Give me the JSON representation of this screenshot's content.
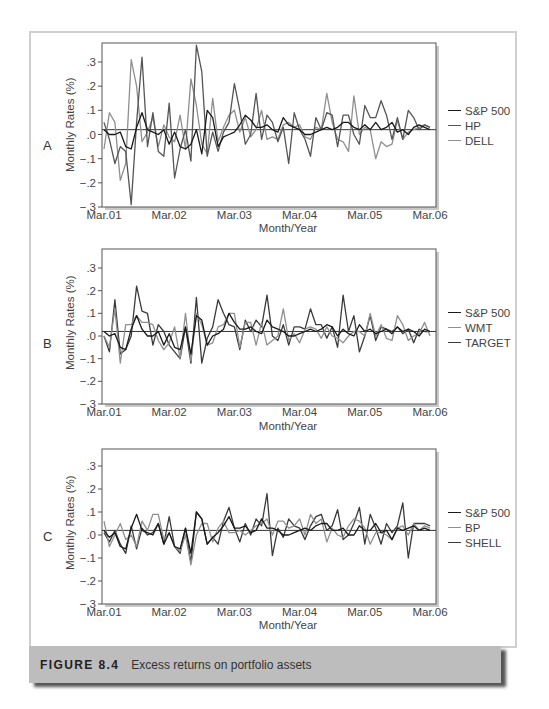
{
  "figure": {
    "number_label": "FIGURE 8.4",
    "caption": "Excess returns on portfolio assets",
    "colors": {
      "caption_bg": "#bdbdbd",
      "frame_border": "#cfcfcf",
      "sp500": "#1a1a1a",
      "second_series": "#555555",
      "third_series": "#8f8f8f"
    }
  },
  "chart_data": [
    {
      "panel": "A",
      "type": "line",
      "title": "",
      "xlabel": "Month/Year",
      "ylabel": "Monthly Rates (%)",
      "ylim": [
        -0.3,
        0.38
      ],
      "yticks": [
        ".3",
        ".2",
        ".1",
        ".0",
        "−.1",
        "−.2",
        "−.3"
      ],
      "ytick_values": [
        0.3,
        0.2,
        0.1,
        0.0,
        -0.1,
        -0.2,
        -0.3
      ],
      "xticks": [
        "Mar.01",
        "Mar.02",
        "Mar.03",
        "Mar.04",
        "Mar.05",
        "Mar.06"
      ],
      "reference_line": 0.02,
      "grid": false,
      "legend_position": "right",
      "x_count": 61,
      "series": [
        {
          "name": "S&P 500",
          "color": "#1a1a1a",
          "width": 1.3,
          "values": [
            0.02,
            0.0,
            0.0,
            0.01,
            -0.05,
            -0.06,
            0.03,
            0.09,
            0.02,
            0.01,
            0.0,
            0.02,
            -0.04,
            0.01,
            -0.05,
            -0.06,
            -0.04,
            0.02,
            -0.08,
            0.1,
            0.07,
            -0.05,
            -0.01,
            0.0,
            0.01,
            0.04,
            0.08,
            0.06,
            0.03,
            0.03,
            0.04,
            0.02,
            0.01,
            0.07,
            0.04,
            0.03,
            0.02,
            0.0,
            0.0,
            0.01,
            0.02,
            0.03,
            0.02,
            0.03,
            0.05,
            0.05,
            0.03,
            0.02,
            0.04,
            0.02,
            0.05,
            0.02,
            0.03,
            0.05,
            0.01,
            0.02,
            0.0,
            0.03,
            0.04,
            0.03,
            0.02
          ]
        },
        {
          "name": "HP",
          "color": "#555555",
          "width": 1.3,
          "values": [
            0.05,
            -0.02,
            -0.12,
            -0.05,
            -0.07,
            -0.29,
            0.05,
            0.32,
            -0.05,
            0.09,
            -0.07,
            -0.09,
            0.13,
            -0.18,
            -0.06,
            0.02,
            -0.11,
            0.37,
            0.26,
            -0.09,
            0.01,
            -0.07,
            0.01,
            0.05,
            0.21,
            0.1,
            -0.04,
            0.0,
            0.17,
            -0.02,
            0.08,
            0.05,
            -0.03,
            0.03,
            -0.12,
            0.09,
            0.02,
            -0.02,
            -0.09,
            0.07,
            0.02,
            0.09,
            0.08,
            -0.05,
            0.08,
            0.08,
            0.0,
            -0.04,
            0.12,
            0.07,
            0.07,
            0.14,
            0.08,
            -0.02,
            0.07,
            -0.02,
            0.1,
            0.07,
            0.02,
            0.04,
            0.03
          ]
        },
        {
          "name": "DELL",
          "color": "#8f8f8f",
          "width": 1.3,
          "values": [
            -0.06,
            0.09,
            0.05,
            -0.19,
            -0.12,
            0.31,
            0.2,
            -0.03,
            0.01,
            0.07,
            -0.05,
            0.04,
            -0.01,
            -0.03,
            0.08,
            -0.06,
            0.23,
            0.12,
            -0.04,
            -0.08,
            0.15,
            -0.03,
            0.03,
            0.08,
            0.1,
            0.01,
            0.07,
            -0.01,
            0.02,
            0.1,
            -0.02,
            -0.01,
            -0.02,
            0.04,
            0.05,
            0.03,
            0.04,
            -0.01,
            -0.02,
            0.03,
            0.02,
            0.17,
            0.05,
            -0.02,
            -0.03,
            -0.07,
            0.16,
            0.0,
            0.03,
            0.02,
            -0.1,
            -0.03,
            -0.05,
            -0.04,
            0.06,
            -0.02,
            0.01,
            0.02,
            0.03,
            0.04,
            0.03
          ]
        }
      ]
    },
    {
      "panel": "B",
      "type": "line",
      "title": "",
      "xlabel": "Month/Year",
      "ylabel": "Monthly Rates (%)",
      "ylim": [
        -0.3,
        0.38
      ],
      "yticks": [
        ".3",
        ".2",
        ".1",
        ".0",
        "−.1",
        "−.2",
        "−.3"
      ],
      "ytick_values": [
        0.3,
        0.2,
        0.1,
        0.0,
        -0.1,
        -0.2,
        -0.3
      ],
      "xticks": [
        "Mar.01",
        "Mar.02",
        "Mar.03",
        "Mar.04",
        "Mar.05",
        "Mar.06"
      ],
      "reference_line": 0.02,
      "grid": false,
      "legend_position": "right",
      "x_count": 61,
      "series": [
        {
          "name": "S&P 500",
          "color": "#1a1a1a",
          "width": 1.3,
          "values": [
            0.02,
            0.0,
            0.01,
            -0.05,
            -0.06,
            0.03,
            0.09,
            0.03,
            0.0,
            0.0,
            0.02,
            -0.04,
            0.01,
            -0.05,
            -0.06,
            0.04,
            -0.08,
            0.09,
            0.07,
            -0.04,
            0.0,
            0.01,
            0.03,
            0.1,
            0.06,
            0.03,
            0.03,
            0.04,
            0.02,
            0.01,
            0.07,
            0.04,
            0.03,
            0.02,
            0.0,
            0.0,
            0.01,
            0.02,
            0.03,
            0.02,
            0.03,
            0.05,
            0.04,
            0.0,
            0.03,
            0.01,
            0.0,
            0.05,
            0.02,
            0.03,
            0.01,
            0.02,
            0.03,
            0.01,
            0.04,
            0.02,
            0.03,
            0.02,
            0.0,
            0.03,
            0.02
          ]
        },
        {
          "name": "WMT",
          "color": "#8f8f8f",
          "width": 1.3,
          "values": [
            0.0,
            -0.05,
            0.12,
            -0.12,
            0.05,
            0.05,
            0.09,
            0.06,
            0.06,
            0.05,
            -0.02,
            -0.06,
            -0.03,
            0.04,
            -0.1,
            0.1,
            -0.11,
            0.1,
            0.05,
            -0.04,
            -0.03,
            0.04,
            0.05,
            0.1,
            0.1,
            -0.05,
            0.06,
            0.06,
            -0.04,
            0.06,
            -0.04,
            -0.02,
            0.0,
            0.12,
            -0.02,
            0.01,
            -0.03,
            0.03,
            0.04,
            0.03,
            -0.01,
            0.04,
            0.0,
            -0.01,
            -0.03,
            0.0,
            0.02,
            0.02,
            0.0,
            0.1,
            0.0,
            0.05,
            -0.01,
            -0.02,
            0.09,
            0.05,
            -0.02,
            0.0,
            0.01,
            0.06,
            0.0
          ]
        },
        {
          "name": "TARGET",
          "color": "#3a3a3a",
          "width": 1.3,
          "values": [
            0.0,
            -0.07,
            0.16,
            -0.08,
            -0.06,
            0.0,
            0.22,
            0.11,
            0.1,
            -0.04,
            0.05,
            0.02,
            -0.04,
            -0.07,
            -0.1,
            0.04,
            -0.12,
            0.17,
            -0.12,
            -0.01,
            0.04,
            0.16,
            0.1,
            0.05,
            0.04,
            -0.06,
            0.07,
            0.02,
            0.07,
            0.04,
            0.18,
            0.0,
            -0.02,
            0.05,
            -0.04,
            0.04,
            0.04,
            0.03,
            0.12,
            0.05,
            0.05,
            -0.01,
            0.04,
            -0.05,
            0.18,
            0.02,
            0.09,
            -0.07,
            0.0,
            0.09,
            -0.02,
            0.04,
            0.03,
            0.02,
            0.04,
            0.01,
            0.03,
            -0.03,
            0.03,
            0.02,
            0.02
          ]
        }
      ]
    },
    {
      "panel": "C",
      "type": "line",
      "title": "",
      "xlabel": "Month/Year",
      "ylabel": "Monthly Rates (%)",
      "ylim": [
        -0.3,
        0.38
      ],
      "yticks": [
        ".3",
        ".2",
        ".1",
        ".0",
        "−.1",
        "−.2",
        "−.3"
      ],
      "ytick_values": [
        0.3,
        0.2,
        0.1,
        0.0,
        -0.1,
        -0.2,
        -0.3
      ],
      "xticks": [
        "Mar.01",
        "Mar.02",
        "Mar.03",
        "Mar.04",
        "Mar.05",
        "Mar.06"
      ],
      "reference_line": 0.02,
      "grid": false,
      "legend_position": "right",
      "x_count": 61,
      "series": [
        {
          "name": "S&P 500",
          "color": "#1a1a1a",
          "width": 1.3,
          "values": [
            0.02,
            -0.01,
            0.01,
            -0.05,
            -0.06,
            0.03,
            0.09,
            0.02,
            0.01,
            0.0,
            0.05,
            -0.04,
            0.01,
            -0.05,
            -0.06,
            0.03,
            -0.08,
            0.1,
            0.07,
            -0.04,
            -0.01,
            0.01,
            0.04,
            0.08,
            0.03,
            0.03,
            0.04,
            0.01,
            0.02,
            0.07,
            0.03,
            0.03,
            0.02,
            0.0,
            0.0,
            0.01,
            0.02,
            0.03,
            0.02,
            0.04,
            0.05,
            0.05,
            0.02,
            0.02,
            0.03,
            0.0,
            0.0,
            0.04,
            0.02,
            0.02,
            0.05,
            0.01,
            0.02,
            -0.02,
            0.03,
            0.02,
            0.03,
            0.04,
            0.02,
            0.03,
            0.02
          ]
        },
        {
          "name": "BP",
          "color": "#8f8f8f",
          "width": 1.3,
          "values": [
            0.06,
            -0.05,
            0.0,
            0.05,
            -0.02,
            0.0,
            -0.05,
            0.06,
            0.02,
            0.09,
            0.09,
            -0.02,
            0.01,
            -0.05,
            -0.07,
            0.0,
            -0.13,
            0.0,
            0.05,
            0.05,
            -0.03,
            0.03,
            0.06,
            0.01,
            0.01,
            0.02,
            0.0,
            0.02,
            0.04,
            0.05,
            0.07,
            0.0,
            0.06,
            0.06,
            0.03,
            0.04,
            0.07,
            0.0,
            0.09,
            0.05,
            0.07,
            -0.03,
            0.03,
            0.0,
            -0.01,
            0.04,
            0.07,
            0.06,
            0.03,
            -0.04,
            0.01,
            0.01,
            0.0,
            -0.02,
            0.03,
            0.04,
            0.0,
            0.05,
            0.02,
            0.04,
            0.03
          ]
        },
        {
          "name": "SHELL",
          "color": "#3a3a3a",
          "width": 1.3,
          "values": [
            0.01,
            -0.03,
            0.02,
            -0.04,
            -0.08,
            0.04,
            -0.06,
            0.03,
            0.0,
            0.01,
            0.05,
            -0.04,
            0.08,
            -0.05,
            -0.08,
            0.03,
            -0.12,
            0.1,
            0.07,
            -0.04,
            -0.01,
            -0.04,
            0.06,
            0.12,
            0.03,
            -0.03,
            0.05,
            0.0,
            0.07,
            0.04,
            0.18,
            -0.09,
            0.03,
            -0.01,
            0.07,
            0.04,
            0.03,
            -0.02,
            0.04,
            0.08,
            0.09,
            0.02,
            0.04,
            0.11,
            -0.02,
            0.0,
            0.05,
            0.12,
            -0.04,
            0.09,
            0.03,
            -0.04,
            0.05,
            0.01,
            0.04,
            0.14,
            -0.1,
            0.05,
            0.05,
            0.05,
            0.04
          ]
        }
      ]
    }
  ]
}
